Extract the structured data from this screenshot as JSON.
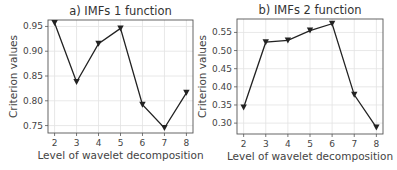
{
  "chart_data": [
    {
      "type": "line",
      "title": "a) IMFs 1 function",
      "xlabel": "Level of wavelet decomposition",
      "ylabel": "Criterion values",
      "x": [
        2,
        3,
        4,
        5,
        6,
        7,
        8
      ],
      "values": [
        0.957,
        0.838,
        0.915,
        0.946,
        0.792,
        0.745,
        0.816
      ],
      "yticks": [
        "0.75",
        "0.80",
        "0.85",
        "0.90",
        "0.95"
      ],
      "ytick_values": [
        0.75,
        0.8,
        0.85,
        0.9,
        0.95
      ],
      "xticks": [
        "2",
        "3",
        "4",
        "5",
        "6",
        "7",
        "8"
      ],
      "ylim": [
        0.735,
        0.963
      ],
      "xlim": [
        1.7,
        8.3
      ],
      "marker": "triangle-down",
      "grid": true,
      "color": "#222222"
    },
    {
      "type": "line",
      "title": "b) IMFs 2 function",
      "xlabel": "Level of wavelet decomposition",
      "ylabel": "Criterion values",
      "x": [
        2,
        3,
        4,
        5,
        6,
        7,
        8
      ],
      "values": [
        0.343,
        0.523,
        0.528,
        0.555,
        0.574,
        0.378,
        0.288
      ],
      "yticks": [
        "0.30",
        "0.35",
        "0.40",
        "0.45",
        "0.50",
        "0.55"
      ],
      "ytick_values": [
        0.3,
        0.35,
        0.4,
        0.45,
        0.5,
        0.55
      ],
      "xticks": [
        "2",
        "3",
        "4",
        "5",
        "6",
        "7",
        "8"
      ],
      "ylim": [
        0.27,
        0.587
      ],
      "xlim": [
        1.7,
        8.3
      ],
      "marker": "triangle-down",
      "grid": true,
      "color": "#222222"
    }
  ],
  "layout": {
    "panels": [
      {
        "left": 48,
        "top": 20,
        "right": 193,
        "bottom": 133
      },
      {
        "left": 237,
        "top": 19,
        "right": 383,
        "bottom": 134
      }
    ]
  }
}
